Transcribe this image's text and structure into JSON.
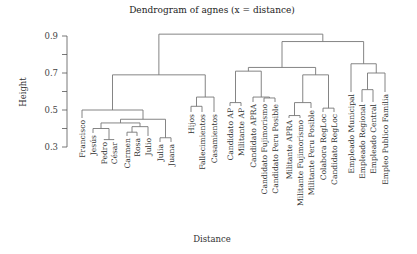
{
  "chart_data": {
    "type": "dendrogram",
    "title": "Dendrogram of agnes (x = distance)",
    "xlabel": "Distance",
    "ylabel": "Height",
    "ylim": [
      0.3,
      0.92
    ],
    "yticks": [
      0.3,
      0.4,
      0.5,
      0.6,
      0.7,
      0.8,
      0.9
    ],
    "ytick_labels": [
      "0.3",
      "",
      "0.5",
      "",
      "0.7",
      "",
      "0.9"
    ],
    "leaves": [
      {
        "label": "Francisco",
        "x": 82
      },
      {
        "label": "Jesús",
        "x": 93
      },
      {
        "label": "Pedro",
        "x": 104
      },
      {
        "label": "César",
        "x": 114
      },
      {
        "label": "Carmen",
        "x": 127
      },
      {
        "label": "Rosa",
        "x": 137
      },
      {
        "label": "Julio",
        "x": 148
      },
      {
        "label": "Julia",
        "x": 160
      },
      {
        "label": "Juana",
        "x": 171
      },
      {
        "label": "Hijos",
        "x": 191
      },
      {
        "label": "Fallecimientos",
        "x": 202
      },
      {
        "label": "Casamientos",
        "x": 214
      },
      {
        "label": "Candidato AP",
        "x": 230
      },
      {
        "label": "Militante AP",
        "x": 241
      },
      {
        "label": "Candidato APRA",
        "x": 253
      },
      {
        "label": "Candidato Fujimorismo",
        "x": 264
      },
      {
        "label": "Candidato Peru Posible",
        "x": 275
      },
      {
        "label": "Militante APRA",
        "x": 289
      },
      {
        "label": "Militante Fujimorismo",
        "x": 300
      },
      {
        "label": "Militante Peru Posible",
        "x": 311
      },
      {
        "label": "Colabora RegLoc",
        "x": 323
      },
      {
        "label": "Candidato RegLoc",
        "x": 334
      },
      {
        "label": "Empleado Municipal",
        "x": 351
      },
      {
        "label": "Empleado Regional",
        "x": 362
      },
      {
        "label": "Empleado Central",
        "x": 373
      },
      {
        "label": "Empleo Publico Familia",
        "x": 385
      }
    ],
    "merges": [
      {
        "left": "Pedro",
        "right": "César",
        "height": 0.34
      },
      {
        "left": "Jesús",
        "right": "Pedro+César",
        "height": 0.4
      },
      {
        "left": "Carmen",
        "right": "Rosa",
        "height": 0.38
      },
      {
        "left": "Carmen+Rosa",
        "right": "Julio",
        "height": 0.41
      },
      {
        "left": "Jesús..César",
        "right": "Carmen..Julio",
        "height": 0.43
      },
      {
        "left": "Julia",
        "right": "Juana",
        "height": 0.35
      },
      {
        "left": "Jesús..Julio",
        "right": "Julia+Juana",
        "height": 0.45
      },
      {
        "left": "Francisco",
        "right": "Jesús..Juana",
        "height": 0.5
      },
      {
        "left": "Hijos",
        "right": "Fallecimientos",
        "height": 0.52
      },
      {
        "left": "Hijos+Fallecimientos",
        "right": "Casamientos",
        "height": 0.57
      },
      {
        "left": "Francisco..Juana",
        "right": "Hijos..Casamientos",
        "height": 0.69
      },
      {
        "left": "Candidato AP",
        "right": "Militante AP",
        "height": 0.54
      },
      {
        "left": "Candidato Fujimorismo",
        "right": "Candidato Peru Posible",
        "height": 0.565
      },
      {
        "left": "Candidato APRA",
        "right": "Cand Fuji+Cand PP",
        "height": 0.57
      },
      {
        "left": "AP pair",
        "right": "Candidato trio",
        "height": 0.71
      },
      {
        "left": "Militante APRA",
        "right": "Militante Fujimorismo",
        "height": 0.47
      },
      {
        "left": "Mil APRA+Mil Fuji",
        "right": "Militante Peru Posible",
        "height": 0.54
      },
      {
        "left": "Colabora RegLoc",
        "right": "Candidato RegLoc",
        "height": 0.51
      },
      {
        "left": "Militante trio",
        "right": "RegLoc pair",
        "height": 0.69
      },
      {
        "left": "Candidato group",
        "right": "Militante/RegLoc group",
        "height": 0.73
      },
      {
        "left": "Empleado Regional",
        "right": "Empleado Central",
        "height": 0.61
      },
      {
        "left": "Emp Reg+Central",
        "right": "Empleo Publico Familia",
        "height": 0.7
      },
      {
        "left": "Empleado Municipal",
        "right": "Empleado trio",
        "height": 0.75
      },
      {
        "left": "Candidato/Militante group",
        "right": "Empleado group",
        "height": 0.87
      },
      {
        "left": "Persons/Events cluster",
        "right": "Political/Employment cluster",
        "height": 0.91
      }
    ]
  }
}
